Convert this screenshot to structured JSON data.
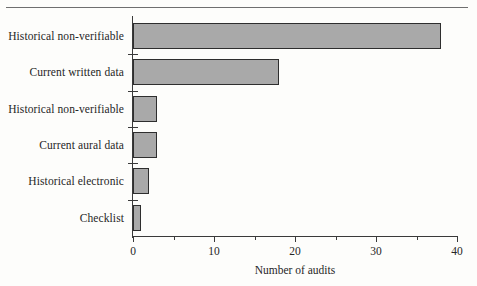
{
  "chart_data": {
    "type": "bar",
    "orientation": "horizontal",
    "title": "",
    "xlabel": "Number of audits",
    "ylabel": "",
    "categories": [
      "Historical non-verifiable",
      "Current written data",
      "Historical non-verifiable",
      "Current aural data",
      "Historical electronic",
      "Checklist"
    ],
    "values": [
      38,
      18,
      3,
      3,
      2,
      1
    ],
    "xlim": [
      0,
      40
    ],
    "xticks": [
      0,
      10,
      20,
      30,
      40
    ],
    "xtick_labels": [
      "0",
      "10",
      "20",
      "30",
      "40"
    ],
    "minor_xticks": [
      5,
      15,
      25,
      35
    ],
    "grid": false,
    "legend": false,
    "bar_color": "#a9a9a9",
    "bar_edge_color": "#2e2e2e",
    "axis_color": "#3a3a3a",
    "background_color": "#fdfdfb"
  }
}
